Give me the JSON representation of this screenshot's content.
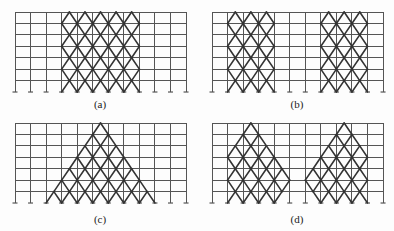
{
  "figure": {
    "bays": 11,
    "stories": 7,
    "bay_width": 15.55,
    "story_height": 11.43,
    "colors": {
      "frame": "#555555",
      "brace": "#333333",
      "background": "#fdfdfd"
    }
  },
  "panels": [
    {
      "id": "a",
      "label": "(a)",
      "origin": [
        15,
        12
      ],
      "label_pos": [
        100,
        105
      ],
      "brace_regions": [
        {
          "left": [
            3.5,
            3,
            3.5,
            3,
            3.5,
            3,
            3.5,
            3
          ],
          "right": [
            7.5,
            8,
            7.5,
            8,
            7.5,
            8,
            7.5,
            8
          ]
        }
      ]
    },
    {
      "id": "b",
      "label": "(b)",
      "origin": [
        212,
        12
      ],
      "label_pos": [
        297,
        105
      ],
      "brace_regions": [
        {
          "left": [
            1.5,
            1,
            1.5,
            1,
            1.5,
            1,
            1.5,
            1
          ],
          "right": [
            3.5,
            4,
            3.5,
            4,
            3.5,
            4,
            3.5,
            4
          ]
        },
        {
          "left": [
            7.5,
            7,
            7.5,
            7,
            7.5,
            7,
            7.5,
            7
          ],
          "right": [
            9.5,
            10,
            9.5,
            10,
            9.5,
            10,
            9.5,
            10
          ]
        }
      ]
    },
    {
      "id": "c",
      "label": "(c)",
      "origin": [
        15,
        123
      ],
      "label_pos": [
        100,
        220
      ],
      "brace_regions": [
        {
          "left": [
            5.5,
            5,
            4.5,
            4,
            3.5,
            3,
            2.5,
            2
          ],
          "right": [
            5.5,
            6,
            6.5,
            7,
            7.5,
            8,
            8.5,
            9
          ]
        }
      ]
    },
    {
      "id": "d",
      "label": "(d)",
      "origin": [
        212,
        123
      ],
      "label_pos": [
        297,
        220
      ],
      "brace_regions": [
        {
          "left": [
            2.5,
            2,
            1.5,
            1,
            1.5,
            1,
            1.5,
            1
          ],
          "right": [
            2.5,
            3,
            3.5,
            4,
            4.5,
            5,
            4.5,
            4
          ]
        },
        {
          "left": [
            8.5,
            8,
            7.5,
            7,
            6.5,
            6,
            6.5,
            7
          ],
          "right": [
            8.5,
            9,
            9.5,
            10,
            9.5,
            10,
            9.5,
            10
          ]
        }
      ]
    }
  ]
}
